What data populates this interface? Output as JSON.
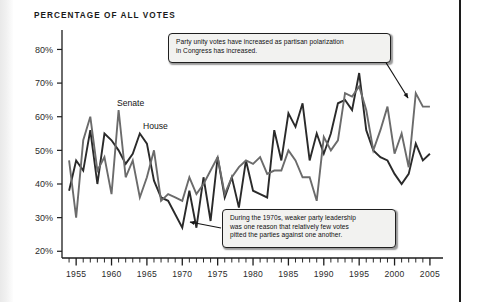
{
  "page": {
    "title": "PERCENTAGE OF ALL VOTES",
    "background": "#ffffff",
    "rule_color": "#1c1c1c"
  },
  "chart_data": {
    "type": "line",
    "title": "PERCENTAGE OF ALL VOTES",
    "xlabel": "",
    "ylabel": "",
    "xlim": [
      1953,
      2006
    ],
    "ylim": [
      18,
      84
    ],
    "grid": false,
    "legend": "inline-labels",
    "y_ticks": [
      "20%",
      "30%",
      "40%",
      "50%",
      "60%",
      "70%",
      "80%"
    ],
    "y_tick_values": [
      20,
      30,
      40,
      50,
      60,
      70,
      80
    ],
    "x_ticks": [
      "1955",
      "1960",
      "1965",
      "1970",
      "1975",
      "1980",
      "1985",
      "1990",
      "1995",
      "2000",
      "2005"
    ],
    "x_tick_values": [
      1955,
      1960,
      1965,
      1970,
      1975,
      1980,
      1985,
      1990,
      1995,
      2000,
      2005
    ],
    "x_minor_tick_step": 1,
    "x": [
      1954,
      1955,
      1956,
      1957,
      1958,
      1959,
      1960,
      1961,
      1962,
      1963,
      1964,
      1965,
      1966,
      1967,
      1968,
      1969,
      1970,
      1971,
      1972,
      1973,
      1974,
      1975,
      1976,
      1977,
      1978,
      1979,
      1980,
      1981,
      1982,
      1983,
      1984,
      1985,
      1986,
      1987,
      1988,
      1989,
      1990,
      1991,
      1992,
      1993,
      1994,
      1995,
      1996,
      1997,
      1998,
      1999,
      2000,
      2001,
      2002,
      2003,
      2004,
      2005
    ],
    "series": [
      {
        "name": "House",
        "color": "#2a2a2a",
        "values": [
          38,
          47,
          44,
          56,
          40,
          55,
          53,
          50,
          46,
          49,
          55,
          52,
          41,
          36,
          35,
          31,
          27,
          38,
          27,
          42,
          29,
          48,
          36,
          42,
          33,
          47,
          38,
          37,
          36,
          56,
          47,
          61,
          57,
          64,
          47,
          55,
          49,
          55,
          64,
          65,
          62,
          73,
          56,
          50,
          48,
          47,
          43,
          40,
          43,
          52,
          47,
          49
        ],
        "style": "solid",
        "width": 1.9
      },
      {
        "name": "Senate",
        "color": "#6b6b6b",
        "values": [
          47,
          30,
          53,
          60,
          44,
          48,
          37,
          62,
          42,
          47,
          36,
          42,
          50,
          35,
          37,
          36,
          35,
          42,
          37,
          40,
          44,
          48,
          37,
          42,
          45,
          47,
          46,
          48,
          43,
          44,
          44,
          50,
          47,
          42,
          42,
          35,
          54,
          50,
          53,
          67,
          66,
          69,
          62,
          50,
          56,
          63,
          49,
          55,
          45,
          67,
          63,
          63
        ],
        "style": "solid",
        "width": 1.9
      }
    ],
    "series_labels": [
      {
        "text": "Senate",
        "x_px": 117,
        "y_px": 106
      },
      {
        "text": "House",
        "x_px": 143,
        "y_px": 129
      }
    ],
    "annotations": [
      {
        "id": "annotation-polarization",
        "lines": [
          "Party unity votes have increased as partisan polarization",
          "in Congress has increased."
        ],
        "box": {
          "left": 168,
          "top": 33,
          "width": 223,
          "height": 30
        },
        "arrow": {
          "from_x": 385,
          "from_y": 61,
          "to_x": 408,
          "to_y": 98
        }
      },
      {
        "id": "annotation-1970s",
        "lines": [
          "During the 1970s, weaker party leadership",
          "was one reason that relatively few votes",
          "pitted the parties against one another."
        ],
        "box": {
          "left": 222,
          "top": 209,
          "width": 174,
          "height": 39
        },
        "arrow": {
          "from_x": 221,
          "from_y": 228,
          "to_x": 190,
          "to_y": 222
        }
      }
    ]
  }
}
